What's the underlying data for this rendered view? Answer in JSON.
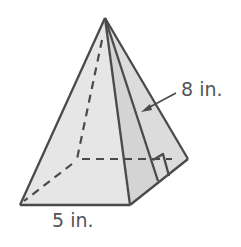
{
  "figure": {
    "type": "square pyramid",
    "labels": {
      "slant_height": "8 in.",
      "base_edge": "5 in."
    },
    "colors": {
      "stroke": "#4a4a4a",
      "front_face": "#e6e6e6",
      "right_face": "#d2d2d2",
      "background": "#ffffff"
    }
  }
}
